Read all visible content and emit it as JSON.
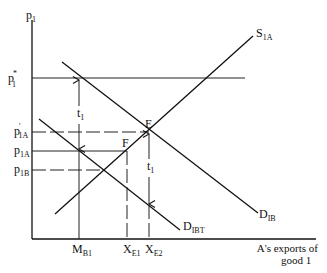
{
  "diagram": {
    "y_axis": {
      "label": "p",
      "label_sub": "1"
    },
    "x_axis": {
      "label_line1": "A's exports of",
      "label_line2": "good 1"
    },
    "price_levels": [
      {
        "id": "p1_star",
        "label": "p",
        "sub": "1",
        "sup": "*"
      },
      {
        "id": "p1a_prime",
        "label": "p",
        "sub": "1A",
        "sup": "'"
      },
      {
        "id": "p1a",
        "label": "p",
        "sub": "1A",
        "sup": ""
      },
      {
        "id": "p1b",
        "label": "p",
        "sub": "1B",
        "sup": ""
      }
    ],
    "curves": [
      {
        "id": "s1a",
        "label": "S",
        "sub": "1A"
      },
      {
        "id": "d1b",
        "label": "D",
        "sub": "IB"
      },
      {
        "id": "d1bt",
        "label": "D",
        "sub": "IBT"
      }
    ],
    "quantities": [
      {
        "id": "mb1",
        "label": "M",
        "sub": "B1"
      },
      {
        "id": "xe1",
        "label": "X",
        "sub": "E1"
      },
      {
        "id": "xe2",
        "label": "X",
        "sub": "E2"
      }
    ],
    "points": [
      {
        "id": "E",
        "label": "E"
      },
      {
        "id": "F",
        "label": "F"
      }
    ],
    "tariff_arrows": [
      {
        "id": "t1_left",
        "label": "t",
        "sub": "1"
      },
      {
        "id": "t1_right",
        "label": "t",
        "sub": "1"
      }
    ]
  }
}
